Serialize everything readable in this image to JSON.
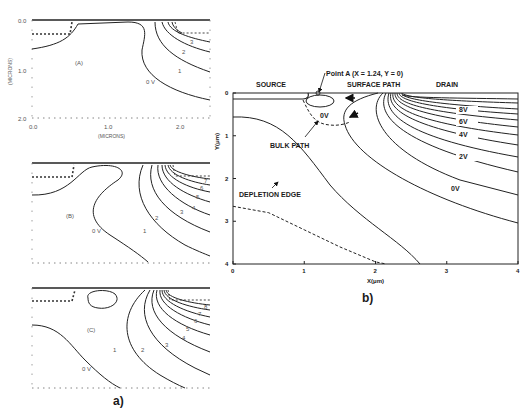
{
  "figure": {
    "panel_a_label": "a)",
    "panel_b_label": "b)"
  },
  "chart_data": [
    {
      "type": "line",
      "panel": "a-A",
      "subtitle": "(A)",
      "xlabel": "(MICRONS)",
      "ylabel": "(MICRONS)",
      "x_ticks": [
        "0.0",
        "1.0",
        "2.0"
      ],
      "y_ticks": [
        "0.0",
        "1.0",
        "2.0"
      ],
      "xlim": [
        0,
        2.0
      ],
      "ylim": [
        0,
        2.0
      ],
      "contour_labels": [
        "0 V",
        "1",
        "2",
        "3"
      ]
    },
    {
      "type": "line",
      "panel": "a-B",
      "subtitle": "(B)",
      "contour_labels": [
        "0 V",
        "1",
        "2",
        "3",
        "4",
        "5",
        "6",
        "7"
      ]
    },
    {
      "type": "line",
      "panel": "a-C",
      "subtitle": "(C)",
      "contour_labels": [
        "0 V",
        "1",
        "2",
        "3",
        "4",
        "5",
        "6",
        "7",
        "8"
      ]
    },
    {
      "type": "line",
      "panel": "b",
      "xlabel": "X(μm)",
      "ylabel": "Y(μm)",
      "xlim": [
        0,
        4
      ],
      "ylim": [
        0,
        4
      ],
      "x_ticks": [
        "0",
        "1",
        "2",
        "3",
        "4"
      ],
      "y_ticks": [
        "0",
        "1",
        "2",
        "3",
        "4"
      ],
      "region_labels": {
        "source": "SOURCE",
        "surface_path": "SURFACE PATH",
        "drain": "DRAIN",
        "bulk_path": "BULK PATH",
        "depletion_edge": "DEPLETION EDGE",
        "point_a": "Point A (X = 1.24, Y = 0)",
        "zero_v_inner": "0V"
      },
      "contour_labels": [
        "8V",
        "6V",
        "4V",
        "2V",
        "0V"
      ],
      "depletion_edge": {
        "x": [
          0,
          0.5,
          1.0,
          1.5,
          2.0,
          2.15
        ],
        "y": [
          2.65,
          2.8,
          3.2,
          3.6,
          3.95,
          4.0
        ]
      }
    }
  ]
}
